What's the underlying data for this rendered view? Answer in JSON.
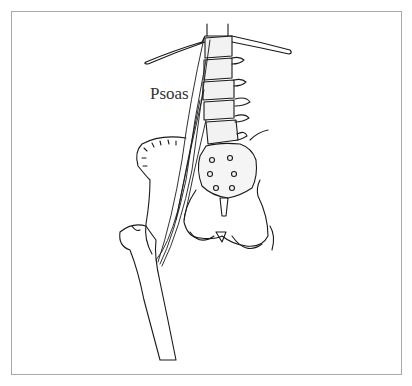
{
  "figure": {
    "label": "Psoas"
  }
}
